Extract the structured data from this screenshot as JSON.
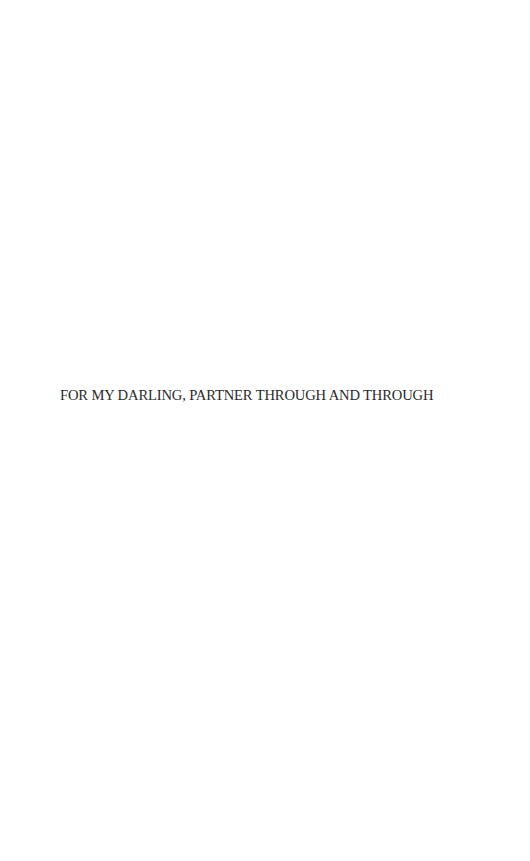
{
  "page": {
    "dedication": "FOR MY DARLING, PARTNER THROUGH AND THROUGH"
  },
  "colors": {
    "background": "#ffffff",
    "text": "#2a2a2a"
  }
}
